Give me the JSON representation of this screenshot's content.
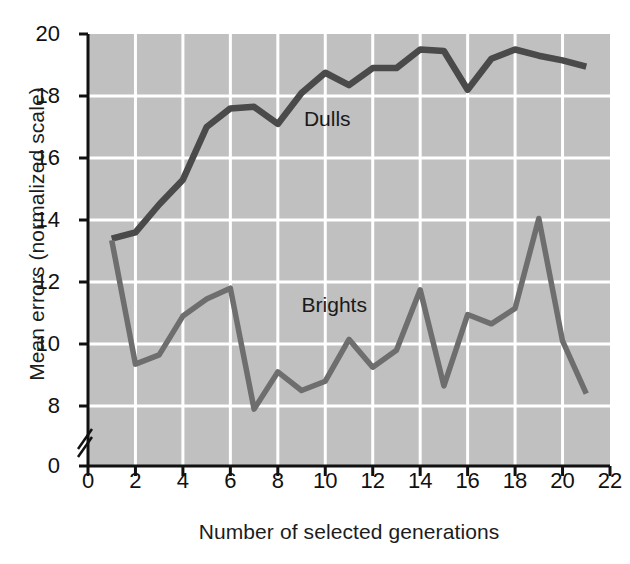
{
  "chart_data": {
    "type": "line",
    "title": "",
    "xlabel": "Number of selected generations",
    "ylabel": "Mean errors (normalized scale)",
    "xlim": [
      0,
      22
    ],
    "ylim": [
      8,
      20
    ],
    "y_axis_break": true,
    "y_axis_break_base_label": "0",
    "grid": true,
    "grid_color": "#ffffff",
    "plot_background": "#c0c0c0",
    "line_color_dulls": "#4a4a4a",
    "line_color_brights": "#6e6e6e",
    "legend_position": "inline-annotation",
    "xticks": [
      0,
      2,
      4,
      6,
      8,
      10,
      12,
      14,
      16,
      18,
      20,
      22
    ],
    "xtick_labels": [
      "0",
      "2",
      "4",
      "6",
      "8",
      "10",
      "12",
      "14",
      "16",
      "18",
      "20",
      "22"
    ],
    "yticks": [
      8,
      10,
      12,
      14,
      16,
      18,
      20
    ],
    "ytick_labels": [
      "8",
      "10",
      "12",
      "14",
      "16",
      "18",
      "20"
    ],
    "x": [
      1,
      2,
      3,
      4,
      5,
      6,
      7,
      8,
      9,
      10,
      11,
      12,
      13,
      14,
      15,
      16,
      17,
      18,
      19,
      20,
      21
    ],
    "series": [
      {
        "name": "Dulls",
        "label": "Dulls",
        "color": "#4a4a4a",
        "values": [
          13.4,
          13.6,
          14.5,
          15.3,
          17.0,
          17.6,
          17.65,
          17.1,
          18.1,
          18.75,
          18.35,
          18.9,
          18.9,
          19.5,
          19.45,
          18.2,
          19.2,
          19.5,
          19.3,
          19.15,
          18.95
        ],
        "label_x": 9.1,
        "label_y": 17.25
      },
      {
        "name": "Brights",
        "label": "Brights",
        "color": "#6e6e6e",
        "values": [
          13.35,
          9.35,
          9.65,
          10.9,
          11.45,
          11.8,
          7.9,
          9.1,
          8.5,
          8.8,
          10.15,
          9.25,
          9.8,
          11.75,
          8.65,
          10.95,
          10.65,
          11.15,
          14.05,
          10.1,
          8.4
        ],
        "label_x": 9.0,
        "label_y": 11.25
      }
    ]
  }
}
